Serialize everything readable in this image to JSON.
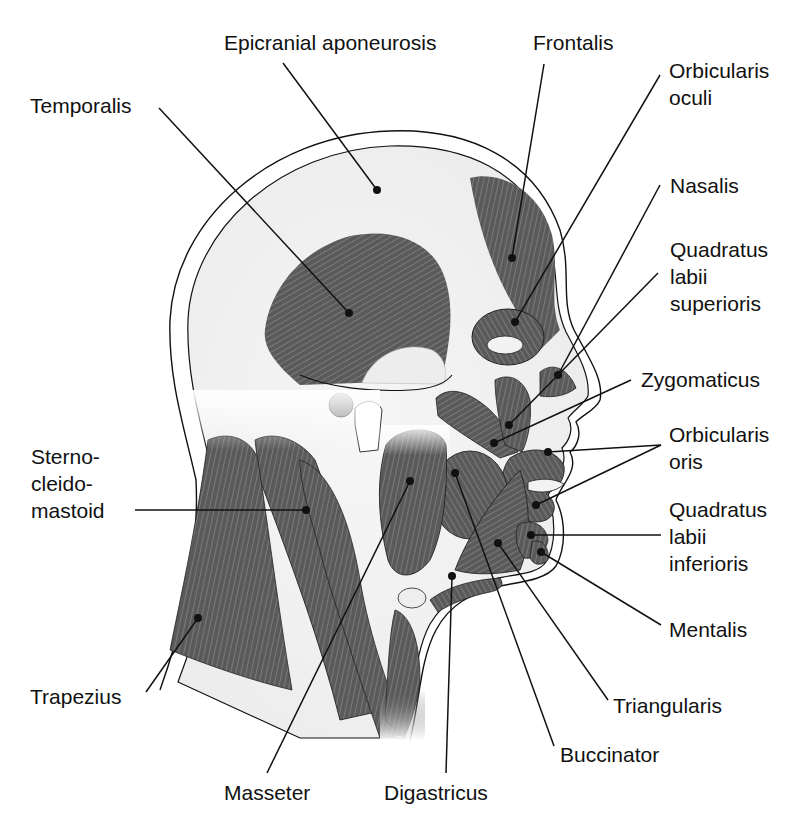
{
  "diagram": {
    "type": "anatomical-illustration",
    "colors": {
      "muscle": "#5a5a5a",
      "muscle_fiber": "#8a8a8a",
      "outline": "#111111",
      "skin_gap": "#ffffff",
      "skull_fill": "#f2f2f2",
      "leader_line": "#111111",
      "background": "#ffffff"
    },
    "labels": {
      "epicranial_aponeurosis": "Epicranial aponeurosis",
      "frontalis": "Frontalis",
      "orbicularis_oculi_1": "Orbicularis",
      "orbicularis_oculi_2": "oculi",
      "temporalis": "Temporalis",
      "nasalis": "Nasalis",
      "quadratus_labii_superioris_1": "Quadratus",
      "quadratus_labii_superioris_2": "labii",
      "quadratus_labii_superioris_3": "superioris",
      "zygomaticus": "Zygomaticus",
      "orbicularis_oris_1": "Orbicularis",
      "orbicularis_oris_2": "oris",
      "sternocleidomastoid_1": "Sterno-",
      "sternocleidomastoid_2": "cleido-",
      "sternocleidomastoid_3": "mastoid",
      "quadratus_labii_inferioris_1": "Quadratus",
      "quadratus_labii_inferioris_2": "labii",
      "quadratus_labii_inferioris_3": "inferioris",
      "mentalis": "Mentalis",
      "trapezius": "Trapezius",
      "triangularis": "Triangularis",
      "buccinator": "Buccinator",
      "masseter": "Masseter",
      "digastricus": "Digastricus"
    },
    "leaders": [
      {
        "name": "epicranial-aponeurosis",
        "from": [
          283,
          63
        ],
        "to": [
          377,
          190
        ]
      },
      {
        "name": "frontalis",
        "from": [
          544,
          64
        ],
        "to": [
          512,
          258
        ]
      },
      {
        "name": "orbicularis-oculi",
        "from": [
          660,
          75
        ],
        "to": [
          515,
          322
        ]
      },
      {
        "name": "temporalis",
        "from": [
          159,
          108
        ],
        "to": [
          349,
          313
        ]
      },
      {
        "name": "nasalis",
        "from": [
          660,
          185
        ],
        "to": [
          558,
          375
        ]
      },
      {
        "name": "quadratus-labii-superioris",
        "from": [
          658,
          273
        ],
        "to": [
          509,
          425
        ]
      },
      {
        "name": "zygomaticus",
        "from": [
          631,
          380
        ],
        "to": [
          494,
          443
        ]
      },
      {
        "name": "orbicularis-oris-upper",
        "from": [
          661,
          445
        ],
        "to": [
          548,
          452
        ]
      },
      {
        "name": "orbicularis-oris-lower",
        "from": [
          661,
          445
        ],
        "to": [
          536,
          505
        ]
      },
      {
        "name": "sternocleidomastoid",
        "from": [
          135,
          510
        ],
        "to": [
          306,
          510
        ]
      },
      {
        "name": "quadratus-labii-inferioris",
        "from": [
          661,
          535
        ],
        "to": [
          531,
          535
        ]
      },
      {
        "name": "mentalis",
        "from": [
          661,
          625
        ],
        "to": [
          541,
          552
        ]
      },
      {
        "name": "trapezius",
        "from": [
          146,
          692
        ],
        "to": [
          198,
          618
        ]
      },
      {
        "name": "triangularis",
        "from": [
          608,
          700
        ],
        "to": [
          498,
          543
        ]
      },
      {
        "name": "buccinator",
        "from": [
          554,
          746
        ],
        "to": [
          455,
          473
        ]
      },
      {
        "name": "masseter",
        "from": [
          267,
          773
        ],
        "to": [
          410,
          481
        ]
      },
      {
        "name": "digastricus",
        "from": [
          446,
          773
        ],
        "to": [
          452,
          576
        ]
      }
    ]
  }
}
